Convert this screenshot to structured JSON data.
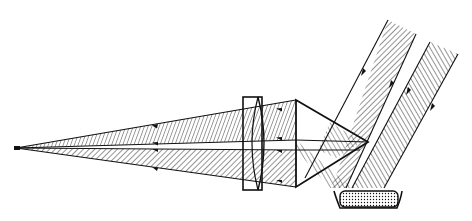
{
  "diagram": {
    "type": "optical-ray-diagram",
    "colors": {
      "ink": "#111111",
      "background": "#ffffff"
    },
    "elements": [
      {
        "name": "incident-beam-1",
        "label": ""
      },
      {
        "name": "incident-beam-2",
        "label": ""
      },
      {
        "name": "prism",
        "label": ""
      },
      {
        "name": "lens",
        "label": ""
      },
      {
        "name": "sample-holder",
        "label": ""
      },
      {
        "name": "focal-point",
        "label": ""
      }
    ],
    "text_labels": []
  }
}
